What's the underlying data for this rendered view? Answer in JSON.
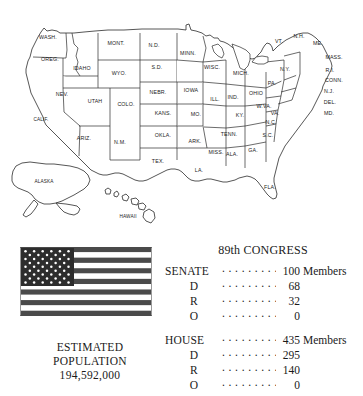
{
  "map": {
    "title": "united-states-map",
    "states": [
      {
        "abbr": "WASH.",
        "x": 48,
        "y": 39
      },
      {
        "abbr": "OREG.",
        "x": 50,
        "y": 61
      },
      {
        "abbr": "IDAHO",
        "x": 82,
        "y": 70
      },
      {
        "abbr": "MONT.",
        "x": 116,
        "y": 45
      },
      {
        "abbr": "WYO.",
        "x": 119,
        "y": 75
      },
      {
        "abbr": "NEV.",
        "x": 62,
        "y": 96
      },
      {
        "abbr": "UTAH",
        "x": 95,
        "y": 103
      },
      {
        "abbr": "COLO.",
        "x": 126,
        "y": 106
      },
      {
        "abbr": "CALIF.",
        "x": 41,
        "y": 121
      },
      {
        "abbr": "ARIZ.",
        "x": 84,
        "y": 140
      },
      {
        "abbr": "N.M.",
        "x": 120,
        "y": 144
      },
      {
        "abbr": "N.D.",
        "x": 154,
        "y": 47
      },
      {
        "abbr": "S.D.",
        "x": 157,
        "y": 69
      },
      {
        "abbr": "NEBR.",
        "x": 158,
        "y": 94
      },
      {
        "abbr": "KANS.",
        "x": 163,
        "y": 115
      },
      {
        "abbr": "OKLA.",
        "x": 163,
        "y": 137
      },
      {
        "abbr": "TEX.",
        "x": 158,
        "y": 163
      },
      {
        "abbr": "MINN.",
        "x": 188,
        "y": 55
      },
      {
        "abbr": "IOWA",
        "x": 191,
        "y": 92
      },
      {
        "abbr": "MO.",
        "x": 196,
        "y": 116
      },
      {
        "abbr": "ARK.",
        "x": 195,
        "y": 143
      },
      {
        "abbr": "LA.",
        "x": 199,
        "y": 172
      },
      {
        "abbr": "WISC.",
        "x": 212,
        "y": 69
      },
      {
        "abbr": "ILL.",
        "x": 215,
        "y": 101
      },
      {
        "abbr": "MISS.",
        "x": 216,
        "y": 154
      },
      {
        "abbr": "IND.",
        "x": 233,
        "y": 99
      },
      {
        "abbr": "MICH.",
        "x": 241,
        "y": 75
      },
      {
        "abbr": "ALA.",
        "x": 232,
        "y": 156
      },
      {
        "abbr": "TENN.",
        "x": 229,
        "y": 136
      },
      {
        "abbr": "KY.",
        "x": 240,
        "y": 117
      },
      {
        "abbr": "OHIO",
        "x": 256,
        "y": 95
      },
      {
        "abbr": "GA.",
        "x": 253,
        "y": 152
      },
      {
        "abbr": "FLA.",
        "x": 270,
        "y": 189
      },
      {
        "abbr": "S.C.",
        "x": 268,
        "y": 137
      },
      {
        "abbr": "N.C.",
        "x": 271,
        "y": 124
      },
      {
        "abbr": "W.VA.",
        "x": 264,
        "y": 108
      },
      {
        "abbr": "VA.",
        "x": 275,
        "y": 115
      },
      {
        "abbr": "PA.",
        "x": 272,
        "y": 85
      },
      {
        "abbr": "N.Y.",
        "x": 285,
        "y": 71
      },
      {
        "abbr": "VT.",
        "x": 279,
        "y": 43
      },
      {
        "abbr": "N.H.",
        "x": 299,
        "y": 38
      },
      {
        "abbr": "ME.",
        "x": 318,
        "y": 45
      },
      {
        "abbr": "MASS.",
        "x": 334,
        "y": 59
      },
      {
        "abbr": "R.I.",
        "x": 330,
        "y": 72
      },
      {
        "abbr": "CONN.",
        "x": 334,
        "y": 82
      },
      {
        "abbr": "N.J.",
        "x": 329,
        "y": 93
      },
      {
        "abbr": "DEL.",
        "x": 330,
        "y": 104
      },
      {
        "abbr": "MD.",
        "x": 329,
        "y": 115
      },
      {
        "abbr": "ALASKA",
        "x": 44,
        "y": 183
      },
      {
        "abbr": "HAWAII",
        "x": 128,
        "y": 218
      }
    ]
  },
  "flag": {
    "name": "united-states-flag",
    "stripe_count": 13,
    "star_rows": 9,
    "star_count": 50,
    "canton_color": "#2d2d2d",
    "stripe_color": "#4a4a4a",
    "background_color": "#ffffff"
  },
  "population": {
    "line1": "ESTIMATED",
    "line2": "POPULATION",
    "value": "194,592,000"
  },
  "congress": {
    "title": "89th CONGRESS",
    "chambers": [
      {
        "name": "SENATE",
        "total": "100",
        "unit": "Members",
        "parties": [
          {
            "label": "D",
            "value": "68"
          },
          {
            "label": "R",
            "value": "32"
          },
          {
            "label": "O",
            "value": "0"
          }
        ]
      },
      {
        "name": "HOUSE",
        "total": "435",
        "unit": "Members",
        "parties": [
          {
            "label": "D",
            "value": "295"
          },
          {
            "label": "R",
            "value": "140"
          },
          {
            "label": "O",
            "value": "0"
          }
        ]
      }
    ]
  }
}
